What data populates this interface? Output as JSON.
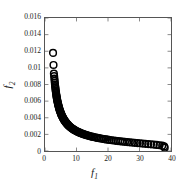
{
  "chart_data": {
    "type": "scatter",
    "title": "",
    "xlabel": "f1",
    "ylabel": "f2",
    "xlabel_base": "f",
    "xlabel_sub": "1",
    "ylabel_base": "f",
    "ylabel_sub": "2",
    "xlim": [
      0,
      40
    ],
    "ylim": [
      0,
      0.016
    ],
    "xticks": [
      0,
      10,
      20,
      30,
      40
    ],
    "xtick_labels": [
      "0",
      "10",
      "20",
      "30",
      "40"
    ],
    "yticks": [
      0,
      0.002,
      0.004,
      0.006,
      0.008,
      0.01,
      0.012,
      0.014,
      0.016
    ],
    "ytick_labels": [
      "0",
      "0.002",
      "0.004",
      "0.006",
      "0.008",
      "0.01",
      "0.012",
      "0.014",
      "0.016"
    ],
    "grid": false,
    "legend": null,
    "marker": "open-circle",
    "marker_color": "#000000",
    "marker_size": 3.4,
    "series": [
      {
        "name": "pareto-front",
        "points": [
          [
            2.55,
            0.0118
          ],
          [
            2.7,
            0.01035
          ],
          [
            2.82,
            0.0093
          ],
          [
            2.9,
            0.009
          ],
          [
            2.98,
            0.0087
          ],
          [
            3.05,
            0.00845
          ],
          [
            3.1,
            0.0082
          ],
          [
            3.16,
            0.008
          ],
          [
            3.22,
            0.0078
          ],
          [
            3.28,
            0.00762
          ],
          [
            3.33,
            0.00745
          ],
          [
            3.38,
            0.00728
          ],
          [
            3.44,
            0.00712
          ],
          [
            3.5,
            0.00697
          ],
          [
            3.56,
            0.00682
          ],
          [
            3.62,
            0.00668
          ],
          [
            3.68,
            0.00654
          ],
          [
            3.74,
            0.0064
          ],
          [
            3.8,
            0.00627
          ],
          [
            3.87,
            0.00614
          ],
          [
            3.93,
            0.00601
          ],
          [
            4.0,
            0.00589
          ],
          [
            4.07,
            0.00577
          ],
          [
            4.14,
            0.00565
          ],
          [
            4.21,
            0.00554
          ],
          [
            4.29,
            0.00543
          ],
          [
            4.36,
            0.00532
          ],
          [
            4.44,
            0.00521
          ],
          [
            4.52,
            0.00511
          ],
          [
            4.6,
            0.005
          ],
          [
            4.69,
            0.0049
          ],
          [
            4.77,
            0.00481
          ],
          [
            4.86,
            0.00471
          ],
          [
            4.95,
            0.00462
          ],
          [
            5.05,
            0.00452
          ],
          [
            5.14,
            0.00443
          ],
          [
            5.24,
            0.00434
          ],
          [
            5.34,
            0.00426
          ],
          [
            5.45,
            0.00417
          ],
          [
            5.56,
            0.00409
          ],
          [
            5.67,
            0.00401
          ],
          [
            5.78,
            0.00393
          ],
          [
            5.9,
            0.00385
          ],
          [
            6.02,
            0.00377
          ],
          [
            6.15,
            0.0037
          ],
          [
            6.28,
            0.00362
          ],
          [
            6.41,
            0.00355
          ],
          [
            6.55,
            0.00348
          ],
          [
            6.69,
            0.00341
          ],
          [
            6.84,
            0.00334
          ],
          [
            6.99,
            0.00327
          ],
          [
            7.15,
            0.0032
          ],
          [
            7.31,
            0.00314
          ],
          [
            7.48,
            0.00307
          ],
          [
            7.65,
            0.00301
          ],
          [
            7.83,
            0.00295
          ],
          [
            8.02,
            0.00289
          ],
          [
            8.21,
            0.00283
          ],
          [
            8.41,
            0.00277
          ],
          [
            8.62,
            0.00271
          ],
          [
            8.83,
            0.00265
          ],
          [
            9.05,
            0.0026
          ],
          [
            9.28,
            0.00254
          ],
          [
            9.52,
            0.00249
          ],
          [
            9.77,
            0.00243
          ],
          [
            10.03,
            0.00238
          ],
          [
            10.29,
            0.00233
          ],
          [
            10.57,
            0.00228
          ],
          [
            10.86,
            0.00223
          ],
          [
            11.15,
            0.00218
          ],
          [
            11.46,
            0.00213
          ],
          [
            11.78,
            0.00208
          ],
          [
            12.11,
            0.00204
          ],
          [
            12.46,
            0.00199
          ],
          [
            12.81,
            0.00195
          ],
          [
            13.18,
            0.0019
          ],
          [
            13.57,
            0.00186
          ],
          [
            13.96,
            0.00182
          ],
          [
            14.37,
            0.00177
          ],
          [
            14.8,
            0.00173
          ],
          [
            15.24,
            0.00169
          ],
          [
            15.7,
            0.00165
          ],
          [
            16.17,
            0.00161
          ],
          [
            16.66,
            0.00157
          ],
          [
            17.16,
            0.00154
          ],
          [
            17.68,
            0.0015
          ],
          [
            18.22,
            0.00146
          ],
          [
            18.78,
            0.00143
          ],
          [
            19.35,
            0.00139
          ],
          [
            19.94,
            0.00136
          ],
          [
            20.55,
            0.00132
          ],
          [
            21.18,
            0.00129
          ],
          [
            21.83,
            0.00126
          ],
          [
            22.49,
            0.00122
          ],
          [
            23.18,
            0.00119
          ],
          [
            23.88,
            0.00116
          ],
          [
            24.6,
            0.00113
          ],
          [
            25.34,
            0.0011
          ],
          [
            26.1,
            0.00107
          ],
          [
            26.88,
            0.00104
          ],
          [
            27.67,
            0.00101
          ],
          [
            28.48,
            0.00098
          ],
          [
            29.31,
            0.00095
          ],
          [
            30.15,
            0.00092
          ],
          [
            31.01,
            0.00089
          ],
          [
            31.88,
            0.00086
          ],
          [
            32.76,
            0.00083
          ],
          [
            33.65,
            0.0008
          ],
          [
            34.55,
            0.00077
          ],
          [
            35.45,
            0.00073
          ],
          [
            36.35,
            0.00069
          ],
          [
            37.2,
            0.00064
          ],
          [
            37.8,
            0.00055
          ],
          [
            38.0,
            0.0004
          ]
        ]
      }
    ]
  }
}
